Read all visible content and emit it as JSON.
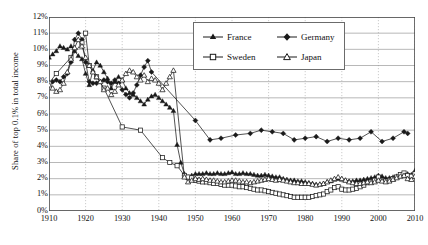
{
  "chart_data": {
    "type": "line",
    "title": "",
    "xlabel": "",
    "ylabel": "Share of top 0.1% in total income",
    "xlim": [
      1910,
      2010
    ],
    "ylim": [
      0,
      12
    ],
    "yunit": "%",
    "grid": true,
    "legend_position": "top-center",
    "xticks": [
      1910,
      1920,
      1930,
      1940,
      1950,
      1960,
      1970,
      1980,
      1990,
      2000,
      2010
    ],
    "xticklabels": [
      "1910",
      "1920",
      "1930",
      "1940",
      "1950",
      "1960",
      "1970",
      "1980",
      "1990",
      "2000",
      "2010"
    ],
    "yticks": [
      0,
      1,
      2,
      3,
      4,
      5,
      6,
      7,
      8,
      9,
      10,
      11,
      12
    ],
    "yticklabels": [
      "0%",
      "1%",
      "2%",
      "3%",
      "4%",
      "5%",
      "6%",
      "7%",
      "8%",
      "9%",
      "10%",
      "11%",
      "12%"
    ],
    "series": [
      {
        "name": "France",
        "marker": "filled-triangle",
        "color": "#1a1a1a",
        "x": [
          1910,
          1911,
          1912,
          1913,
          1914,
          1915,
          1916,
          1917,
          1918,
          1919,
          1920,
          1921,
          1922,
          1923,
          1924,
          1925,
          1926,
          1927,
          1928,
          1929,
          1930,
          1931,
          1932,
          1933,
          1934,
          1935,
          1936,
          1937,
          1938,
          1939,
          1940,
          1941,
          1942,
          1943,
          1944,
          1945,
          1946,
          1947,
          1948,
          1949,
          1950,
          1951,
          1952,
          1953,
          1954,
          1955,
          1956,
          1957,
          1958,
          1959,
          1960,
          1961,
          1962,
          1963,
          1964,
          1965,
          1966,
          1967,
          1968,
          1969,
          1970,
          1971,
          1972,
          1973,
          1974,
          1975,
          1976,
          1977,
          1978,
          1979,
          1980,
          1981,
          1982,
          1983,
          1984,
          1985,
          1986,
          1987,
          1988,
          1989,
          1990,
          1991,
          1992,
          1993,
          1994,
          1995,
          1996,
          1997,
          1998,
          1999,
          2000,
          2001,
          2002,
          2003,
          2004,
          2005,
          2006,
          2007,
          2008,
          2009,
          2010
        ],
        "y": [
          9.5,
          9.7,
          9.9,
          10.2,
          10.1,
          10.0,
          10.2,
          9.9,
          9.6,
          9.4,
          8.5,
          7.8,
          8.7,
          9.2,
          9.0,
          8.6,
          8.2,
          7.6,
          8.0,
          8.3,
          8.1,
          7.6,
          7.3,
          7.2,
          7.0,
          6.8,
          6.6,
          6.9,
          7.1,
          7.2,
          7.0,
          6.8,
          6.6,
          6.4,
          6.2,
          4.1,
          3.0,
          2.3,
          2.1,
          2.2,
          2.3,
          2.3,
          2.3,
          2.35,
          2.3,
          2.3,
          2.35,
          2.3,
          2.3,
          2.35,
          2.4,
          2.3,
          2.3,
          2.35,
          2.3,
          2.3,
          2.25,
          2.2,
          2.2,
          2.25,
          2.2,
          2.15,
          2.1,
          2.1,
          2.0,
          1.95,
          1.9,
          1.9,
          1.85,
          1.85,
          1.8,
          1.75,
          1.7,
          1.65,
          1.65,
          1.7,
          1.8,
          1.85,
          1.95,
          2.0,
          1.95,
          1.9,
          1.85,
          1.85,
          1.9,
          1.9,
          1.95,
          2.0,
          2.05,
          2.1,
          2.2,
          2.15,
          2.05,
          2.05,
          2.1,
          2.15,
          2.2,
          2.3,
          2.3,
          2.25,
          2.5
        ]
      },
      {
        "name": "Germany",
        "marker": "filled-diamond",
        "color": "#1a1a1a",
        "x": [
          1910,
          1911,
          1912,
          1913,
          1914,
          1915,
          1916,
          1917,
          1918,
          1919,
          1920,
          1921,
          1922,
          1923,
          1924,
          1925,
          1926,
          1927,
          1928,
          1929,
          1930,
          1931,
          1932,
          1933,
          1934,
          1935,
          1936,
          1937,
          1938,
          1950,
          1954,
          1957,
          1961,
          1965,
          1968,
          1971,
          1974,
          1977,
          1980,
          1983,
          1986,
          1989,
          1992,
          1995,
          1998,
          2001,
          2004,
          2007,
          2008
        ],
        "y": [
          7.9,
          8.0,
          8.1,
          8.0,
          8.3,
          8.5,
          9.2,
          10.6,
          11.0,
          10.6,
          9.2,
          8.0,
          7.9,
          7.9,
          8.0,
          8.1,
          8.0,
          7.9,
          8.1,
          7.9,
          7.5,
          7.2,
          7.0,
          7.3,
          7.8,
          8.4,
          8.9,
          9.3,
          8.6,
          5.6,
          4.4,
          4.5,
          4.7,
          4.8,
          5.0,
          4.9,
          4.8,
          4.4,
          4.5,
          4.6,
          4.3,
          4.5,
          4.4,
          4.5,
          4.9,
          4.3,
          4.5,
          4.9,
          4.8
        ]
      },
      {
        "name": "Sweden",
        "marker": "open-square",
        "color": "#1a1a1a",
        "x": [
          1910,
          1912,
          1916,
          1919,
          1920,
          1921,
          1923,
          1925,
          1930,
          1935,
          1941,
          1943,
          1945,
          1947,
          1948,
          1949,
          1950,
          1951,
          1952,
          1953,
          1954,
          1955,
          1956,
          1957,
          1958,
          1959,
          1960,
          1961,
          1962,
          1963,
          1964,
          1965,
          1966,
          1967,
          1968,
          1969,
          1970,
          1971,
          1972,
          1973,
          1974,
          1975,
          1976,
          1977,
          1978,
          1979,
          1980,
          1981,
          1982,
          1983,
          1984,
          1985,
          1986,
          1987,
          1988,
          1989,
          1990,
          1991,
          1992,
          1993,
          1994,
          1995,
          1996,
          1997,
          1998,
          1999,
          2000,
          2001,
          2002,
          2003,
          2004,
          2005,
          2006,
          2007,
          2008,
          2009,
          2010
        ],
        "y": [
          7.9,
          8.5,
          9.5,
          10.4,
          11.0,
          9.0,
          8.3,
          7.6,
          5.2,
          5.0,
          3.3,
          3.0,
          2.8,
          2.2,
          2.1,
          2.05,
          1.9,
          1.85,
          1.8,
          1.8,
          1.75,
          1.7,
          1.7,
          1.65,
          1.6,
          1.6,
          1.6,
          1.55,
          1.5,
          1.5,
          1.45,
          1.4,
          1.35,
          1.3,
          1.3,
          1.25,
          1.2,
          1.15,
          1.1,
          1.05,
          1.0,
          0.95,
          0.9,
          0.85,
          0.85,
          0.85,
          0.85,
          0.85,
          0.9,
          0.95,
          1.0,
          1.05,
          1.2,
          1.3,
          1.45,
          1.5,
          1.35,
          1.3,
          1.3,
          1.35,
          1.4,
          1.5,
          1.6,
          1.75,
          1.8,
          1.9,
          2.1,
          1.9,
          1.85,
          1.9,
          2.0,
          2.1,
          2.25,
          2.35,
          2.2,
          2.15,
          2.3
        ]
      },
      {
        "name": "Japan",
        "marker": "open-triangle",
        "color": "#1a1a1a",
        "x": [
          1910,
          1911,
          1912,
          1913,
          1914,
          1915,
          1916,
          1917,
          1918,
          1919,
          1920,
          1921,
          1922,
          1923,
          1924,
          1925,
          1926,
          1927,
          1928,
          1929,
          1930,
          1931,
          1932,
          1933,
          1934,
          1935,
          1936,
          1937,
          1938,
          1939,
          1940,
          1941,
          1942,
          1943,
          1944,
          1947,
          1948,
          1949,
          1950,
          1951,
          1952,
          1953,
          1954,
          1955,
          1956,
          1957,
          1958,
          1959,
          1960,
          1961,
          1962,
          1963,
          1964,
          1965,
          1966,
          1967,
          1968,
          1969,
          1970,
          1971,
          1972,
          1973,
          1974,
          1975,
          1976,
          1977,
          1978,
          1979,
          1980,
          1981,
          1982,
          1983,
          1984,
          1985,
          1986,
          1987,
          1988,
          1989,
          1990,
          1991,
          1992,
          1993,
          1994,
          1995,
          1996,
          1997,
          1998,
          1999,
          2000,
          2001,
          2002,
          2003,
          2004,
          2005,
          2006,
          2007,
          2008,
          2009,
          2010
        ],
        "y": [
          7.8,
          7.6,
          7.4,
          7.5,
          7.9,
          8.6,
          9.4,
          10.1,
          10.6,
          10.2,
          9.5,
          9.0,
          8.6,
          8.3,
          8.0,
          7.5,
          7.6,
          7.2,
          7.4,
          7.8,
          8.1,
          8.5,
          8.7,
          8.6,
          8.3,
          8.1,
          8.4,
          8.0,
          8.2,
          8.1,
          7.9,
          7.5,
          7.9,
          8.3,
          8.7,
          2.1,
          1.8,
          1.9,
          2.0,
          1.95,
          2.0,
          1.95,
          1.9,
          1.9,
          1.85,
          1.8,
          1.8,
          1.85,
          1.9,
          1.9,
          1.85,
          1.8,
          1.8,
          1.75,
          1.8,
          1.85,
          1.9,
          1.95,
          2.0,
          1.95,
          1.9,
          1.95,
          1.9,
          1.85,
          1.8,
          1.75,
          1.75,
          1.7,
          1.7,
          1.7,
          1.65,
          1.6,
          1.65,
          1.7,
          1.8,
          1.9,
          2.0,
          2.1,
          2.0,
          1.9,
          1.8,
          1.75,
          1.7,
          1.7,
          1.75,
          1.8,
          1.75,
          1.8,
          1.9,
          1.85,
          1.8,
          1.85,
          1.95,
          2.05,
          2.15,
          2.2,
          2.0,
          1.95,
          2.15
        ]
      }
    ]
  },
  "axis": {
    "ylabel": "Share of top 0.1% in total income",
    "yticklabels": [
      "12%",
      "11%",
      "10%",
      "9%",
      "8%",
      "7%",
      "6%",
      "5%",
      "4%",
      "3%",
      "2%",
      "1%",
      "0%"
    ],
    "xticklabels": [
      "1910",
      "1920",
      "1930",
      "1940",
      "1950",
      "1960",
      "1970",
      "1980",
      "1990",
      "2000",
      "2010"
    ]
  },
  "legend": {
    "entries": [
      {
        "label": "France",
        "marker": "filled-triangle"
      },
      {
        "label": "Germany",
        "marker": "filled-diamond"
      },
      {
        "label": "Sweden",
        "marker": "open-square"
      },
      {
        "label": "Japan",
        "marker": "open-triangle"
      }
    ]
  },
  "colors": {
    "ink": "#1a1a1a",
    "grid": "#9a9a9a",
    "axis": "#555555",
    "vgrid": "#bfbfbf"
  }
}
